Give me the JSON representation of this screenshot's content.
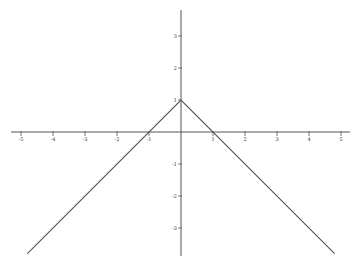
{
  "chart_data": {
    "type": "line",
    "title": "",
    "xlabel": "",
    "ylabel": "",
    "function": "y = 1 - |x|",
    "xlim": [
      -5.2,
      5.3
    ],
    "ylim": [
      -3.9,
      3.8
    ],
    "grid": false,
    "legend": null,
    "x_ticks": [
      -5,
      -4,
      -3,
      -2,
      -1,
      1,
      2,
      3,
      4,
      5
    ],
    "x_tick_labels": [
      "-5",
      "-4",
      "-3",
      "-2",
      "-1",
      "1",
      "2",
      "3",
      "4",
      "5"
    ],
    "y_ticks": [
      3,
      2,
      1,
      -1,
      -2,
      -3
    ],
    "y_tick_labels": [
      "3",
      "2",
      "1",
      "-1",
      "-2",
      "-3"
    ],
    "series": [
      {
        "name": "y = 1 - |x|",
        "color": "#555555",
        "x": [
          -4.8,
          0,
          4.8
        ],
        "y": [
          -3.8,
          1,
          -3.8
        ]
      }
    ]
  },
  "style": {
    "axis_color": "#555555",
    "line_color": "#555555",
    "background": "#ffffff"
  },
  "layout": {
    "origin_px": [
      181,
      132
    ],
    "unit_px": 32
  }
}
